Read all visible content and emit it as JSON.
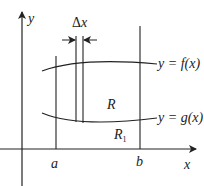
{
  "diagram": {
    "type": "area-between-curves",
    "stroke_color": "#222222",
    "axes": {
      "x_label": "x",
      "y_label": "y"
    },
    "curves": [
      {
        "id": "f",
        "label": "y = f(x)",
        "role": "upper"
      },
      {
        "id": "g",
        "label": "y = g(x)",
        "role": "lower"
      }
    ],
    "bounds": {
      "a_label": "a",
      "b_label": "b"
    },
    "strip": {
      "label_symbol": "Δ",
      "label_var": "x"
    },
    "regions": [
      {
        "id": "R",
        "label": "R"
      },
      {
        "id": "R1",
        "label": "R",
        "subscript": "1"
      }
    ]
  }
}
